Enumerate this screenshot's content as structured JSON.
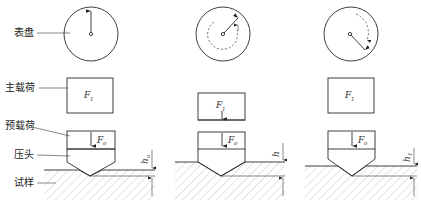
{
  "diagram": {
    "labels": {
      "dial": "表盘",
      "main_load": "主载荷",
      "preload": "预载荷",
      "indenter": "压头",
      "specimen": "试样"
    },
    "symbols": {
      "main_load_var": "F",
      "main_load_sub": "1",
      "preload_var": "F",
      "preload_sub": "o",
      "depth_var": "h",
      "depth_sub_stage1": "o",
      "depth_sub_stage3": "1"
    },
    "stages": [
      {
        "name": "preload-applied",
        "dial": "pointer-up",
        "depth_label": "h0",
        "main_load_on_indenter": false
      },
      {
        "name": "main-load-applied",
        "dial": "pointer-rotated-clockwise",
        "depth_label": "h",
        "main_load_on_indenter": true
      },
      {
        "name": "main-load-removed",
        "dial": "pointer-returned",
        "depth_label": "h1",
        "main_load_on_indenter": false
      }
    ],
    "colors": {
      "line": "#2a2a2a",
      "hatch": "#8a8a8a",
      "background": "#ffffff"
    }
  }
}
